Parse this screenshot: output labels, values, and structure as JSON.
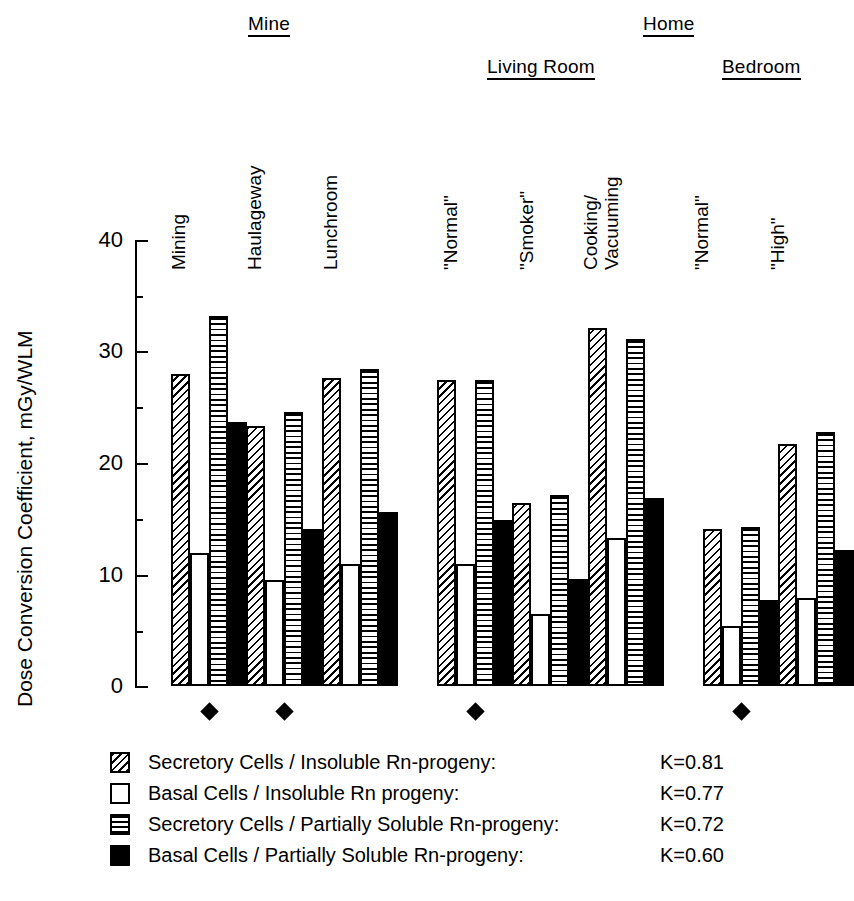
{
  "chart_data": {
    "type": "bar",
    "title": "",
    "xlabel": "",
    "ylabel": "Dose Conversion Coefficient, mGy/WLM",
    "ylim": [
      0,
      40
    ],
    "yticks": [
      0,
      10,
      20,
      30,
      40
    ],
    "ytick_labels": [
      "0",
      "10",
      "20",
      "30",
      "40"
    ],
    "yminor_ticks": [
      5,
      15,
      25,
      35
    ],
    "grid": false,
    "legend_position": "below-axes",
    "categories": [
      "Mining",
      "Haulageway",
      "Lunchroom",
      "\"Normal\"",
      "\"Smoker\"",
      "Cooking/\nVacuuming",
      "\"Normal\"",
      "\"High\""
    ],
    "supergroups": [
      {
        "label": "Mine",
        "categories": [
          "Mining",
          "Haulageway",
          "Lunchroom"
        ]
      },
      {
        "label": "Home",
        "categories": [
          "\"Normal\"",
          "\"Smoker\"",
          "Cooking/ Vacuuming",
          "\"Normal\"",
          "\"High\""
        ]
      }
    ],
    "subgroups": [
      {
        "label": "Living Room",
        "categories": [
          "\"Normal\"",
          "\"Smoker\"",
          "Cooking/ Vacuuming"
        ]
      },
      {
        "label": "Bedroom",
        "categories": [
          "\"Normal\"",
          "\"High\""
        ]
      }
    ],
    "series": [
      {
        "name": "Secretory Cells / Insoluble Rn-progeny:",
        "pattern": "diagonal-hatch",
        "K": "K=0.81",
        "values": [
          28.0,
          23.3,
          27.6,
          27.4,
          16.4,
          32.1,
          14.1,
          21.7
        ]
      },
      {
        "name": "Basal Cells / Insoluble Rn progeny:",
        "pattern": "white",
        "K": "K=0.77",
        "values": [
          11.9,
          9.5,
          10.9,
          10.9,
          6.5,
          13.3,
          5.4,
          7.9
        ]
      },
      {
        "name": "Secretory Cells / Partially Soluble Rn-progeny:",
        "pattern": "horizontal-lines",
        "K": "K=0.72",
        "values": [
          33.2,
          24.6,
          28.4,
          27.4,
          17.1,
          31.1,
          14.3,
          22.8
        ]
      },
      {
        "name": "Basal Cells / Partially Soluble Rn-progeny:",
        "pattern": "solid-black",
        "K": "K=0.60",
        "values": [
          23.7,
          14.1,
          15.6,
          14.9,
          9.6,
          16.9,
          7.7,
          12.2
        ]
      }
    ],
    "markers": {
      "symbol": "filled-diamond",
      "marked_categories": [
        "Mining",
        "Haulageway",
        "\"Normal\" (Living Room)",
        "\"Normal\" (Bedroom)"
      ],
      "marked_indices": [
        0,
        1,
        3,
        6
      ]
    },
    "colors": {
      "foreground": "#000000",
      "background": "#ffffff"
    }
  },
  "legend": {
    "rows": [
      {
        "label": "Secretory Cells / Insoluble Rn-progeny:",
        "k": "K=0.81",
        "swatch": "diagonal-hatch"
      },
      {
        "label": "Basal Cells / Insoluble Rn progeny:",
        "k": "K=0.77",
        "swatch": "white"
      },
      {
        "label": "Secretory Cells / Partially Soluble Rn-progeny:",
        "k": "K=0.72",
        "swatch": "horizontal-lines"
      },
      {
        "label": "Basal Cells / Partially Soluble Rn-progeny:",
        "k": "K=0.60",
        "swatch": "solid-black"
      }
    ]
  },
  "axis": {
    "y_title": "Dose Conversion Coefficient, mGy/WLM",
    "tick_0": "0",
    "tick_10": "10",
    "tick_20": "20",
    "tick_30": "30",
    "tick_40": "40"
  },
  "headers": {
    "mine": "Mine",
    "home": "Home",
    "living_room": "Living Room",
    "bedroom": "Bedroom"
  },
  "cat_labels": {
    "mining": "Mining",
    "haulageway": "Haulageway",
    "lunchroom": "Lunchroom",
    "lr_normal": "\"Normal\"",
    "lr_smoker": "\"Smoker\"",
    "cooking": "Cooking/",
    "vacuuming": "Vacuuming",
    "bed_normal": "\"Normal\"",
    "bed_high": "\"High\""
  }
}
